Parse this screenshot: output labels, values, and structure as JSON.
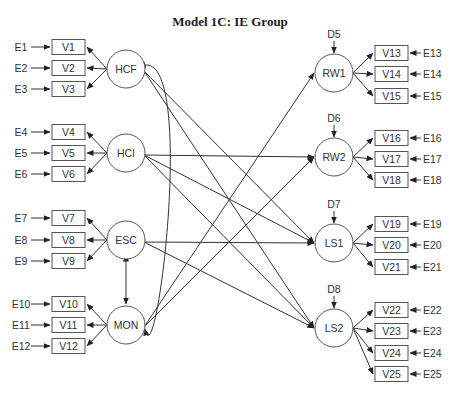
{
  "title": "Model 1C:  IE Group",
  "latent_left": [
    {
      "id": "HCF",
      "label": "HCF",
      "cx": 126,
      "cy": 69,
      "indicators": [
        {
          "v": "V1",
          "e": "E1",
          "y": 47
        },
        {
          "v": "V2",
          "e": "E2",
          "y": 68
        },
        {
          "v": "V3",
          "e": "E3",
          "y": 89
        }
      ]
    },
    {
      "id": "HCI",
      "label": "HCI",
      "cx": 126,
      "cy": 153,
      "indicators": [
        {
          "v": "V4",
          "e": "E4",
          "y": 132
        },
        {
          "v": "V5",
          "e": "E5",
          "y": 153
        },
        {
          "v": "V6",
          "e": "E6",
          "y": 174
        }
      ]
    },
    {
      "id": "ESC",
      "label": "ESC",
      "cx": 126,
      "cy": 240,
      "indicators": [
        {
          "v": "V7",
          "e": "E7",
          "y": 218
        },
        {
          "v": "V8",
          "e": "E8",
          "y": 240
        },
        {
          "v": "V9",
          "e": "E9",
          "y": 261
        }
      ]
    },
    {
      "id": "MON",
      "label": "MON",
      "cx": 126,
      "cy": 325,
      "indicators": [
        {
          "v": "V10",
          "e": "E10",
          "y": 304
        },
        {
          "v": "V11",
          "e": "E11",
          "y": 325
        },
        {
          "v": "V12",
          "e": "E12",
          "y": 346
        }
      ]
    }
  ],
  "latent_right": [
    {
      "id": "RW1",
      "label": "RW1",
      "cx": 334,
      "cy": 73,
      "disturbance": "D5",
      "indicators": [
        {
          "v": "V13",
          "e": "E13",
          "y": 53
        },
        {
          "v": "V14",
          "e": "E14",
          "y": 74
        },
        {
          "v": "V15",
          "e": "E15",
          "y": 96
        }
      ]
    },
    {
      "id": "RW2",
      "label": "RW2",
      "cx": 334,
      "cy": 157,
      "disturbance": "D6",
      "indicators": [
        {
          "v": "V16",
          "e": "E16",
          "y": 138
        },
        {
          "v": "V17",
          "e": "E17",
          "y": 159
        },
        {
          "v": "V18",
          "e": "E18",
          "y": 180
        }
      ]
    },
    {
      "id": "LS1",
      "label": "LS1",
      "cx": 334,
      "cy": 243,
      "disturbance": "D7",
      "indicators": [
        {
          "v": "V19",
          "e": "E19",
          "y": 224
        },
        {
          "v": "V20",
          "e": "E20",
          "y": 245
        },
        {
          "v": "V21",
          "e": "E21",
          "y": 267
        }
      ]
    },
    {
      "id": "LS2",
      "label": "LS2",
      "cx": 334,
      "cy": 328,
      "disturbance": "D8",
      "indicators": [
        {
          "v": "V22",
          "e": "E22",
          "y": 310
        },
        {
          "v": "V23",
          "e": "E23",
          "y": 331
        },
        {
          "v": "V24",
          "e": "E24",
          "y": 353
        },
        {
          "v": "V25",
          "e": "E25",
          "y": 374
        }
      ]
    }
  ],
  "structural_paths": [
    {
      "from": "HCF",
      "to": "LS1"
    },
    {
      "from": "HCF",
      "to": "LS2"
    },
    {
      "from": "HCI",
      "to": "RW2"
    },
    {
      "from": "HCI",
      "to": "LS1"
    },
    {
      "from": "HCI",
      "to": "LS2"
    },
    {
      "from": "ESC",
      "to": "LS1"
    },
    {
      "from": "ESC",
      "to": "LS2"
    },
    {
      "from": "MON",
      "to": "RW1"
    },
    {
      "from": "MON",
      "to": "RW2"
    }
  ],
  "covariances": [
    {
      "a": "HCF",
      "b": "MON",
      "style": "curved"
    },
    {
      "a": "ESC",
      "b": "MON",
      "style": "straight"
    }
  ]
}
